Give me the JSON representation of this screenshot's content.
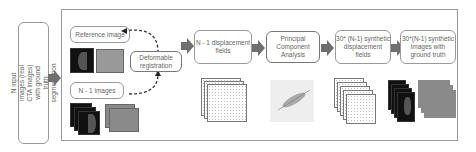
{
  "input_box": {
    "label": "N input images (real CTA images) with ground truth segmentation"
  },
  "boxes": {
    "reference": "Reference image",
    "n_minus_1": "N - 1 images",
    "registration": "Deformable registration",
    "disp_fields": "N - 1 displacement fields",
    "pca": "Principal Component Analysis",
    "synth_fields": "30* (N-1) synthetic displacement fields",
    "synth_images": "30*(N-1) synthetic images with ground truth"
  },
  "colors": {
    "arrow": "#6f6f6f",
    "border": "#999999",
    "dark_image": "#111111",
    "gray_image": "#8a8a8a"
  }
}
